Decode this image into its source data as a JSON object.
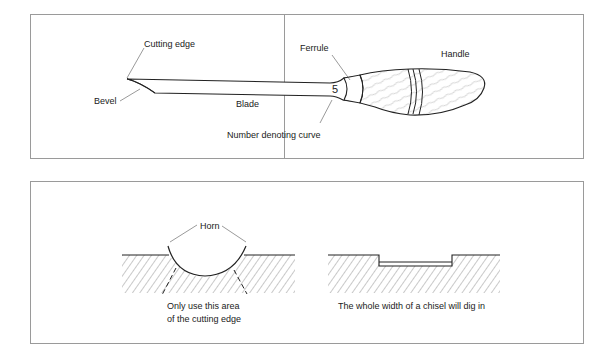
{
  "figure_top": {
    "title": "Anatomy of a woodcarving gouge",
    "labels": {
      "cutting_edge": "Cutting edge",
      "bevel": "Bevel",
      "blade": "Blade",
      "ferrule": "Ferrule",
      "handle": "Handle",
      "number_denoting_curve": "Number denoting curve",
      "sweep_number": "5"
    }
  },
  "figure_bottom": {
    "left": {
      "horn_label": "Horn",
      "caption_line1": "Only use this area",
      "caption_line2": "of the cutting edge"
    },
    "right": {
      "caption": "The whole width of a chisel will dig in"
    }
  },
  "colors": {
    "border": "#9a9a9a",
    "ink": "#222222",
    "hatch": "#6f6f6f"
  }
}
